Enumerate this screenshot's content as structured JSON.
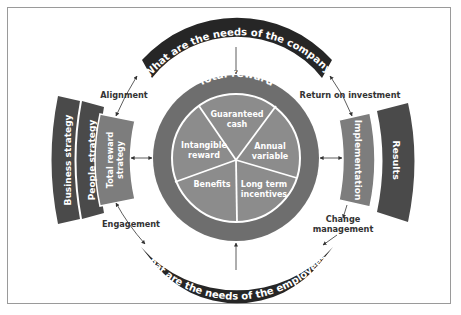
{
  "diagram": {
    "title": "Total reward",
    "colors": {
      "dark_banner": "#262626",
      "outer_ring": "#6e6e6e",
      "pie_fill": "#8c8c8c",
      "mid_panel": "#7d7d7d",
      "dark_panel": "#4a4a4a",
      "label_text": "#333333",
      "frame": "#9a9a9a"
    },
    "top_banner": "What are the needs of the company?",
    "bottom_banner": "What are the needs of the employees?",
    "pie_segments": [
      {
        "line1": "Guaranteed",
        "line2": "cash"
      },
      {
        "line1": "Annual",
        "line2": "variable"
      },
      {
        "line1": "Long term",
        "line2": "incentives"
      },
      {
        "line1": "Benefits",
        "line2": ""
      },
      {
        "line1": "Intangible",
        "line2": "reward"
      }
    ],
    "left_panels": [
      {
        "label": "Business strategy"
      },
      {
        "label": "People strategy"
      },
      {
        "line1": "Total reward",
        "line2": "strategy"
      }
    ],
    "right_panels": [
      {
        "label": "Implementation"
      },
      {
        "label": "Results"
      }
    ],
    "connectors": {
      "alignment": "Alignment",
      "return_on_investment": "Return on investment",
      "engagement": "Engagement",
      "change_line1": "Change",
      "change_line2": "management"
    }
  }
}
